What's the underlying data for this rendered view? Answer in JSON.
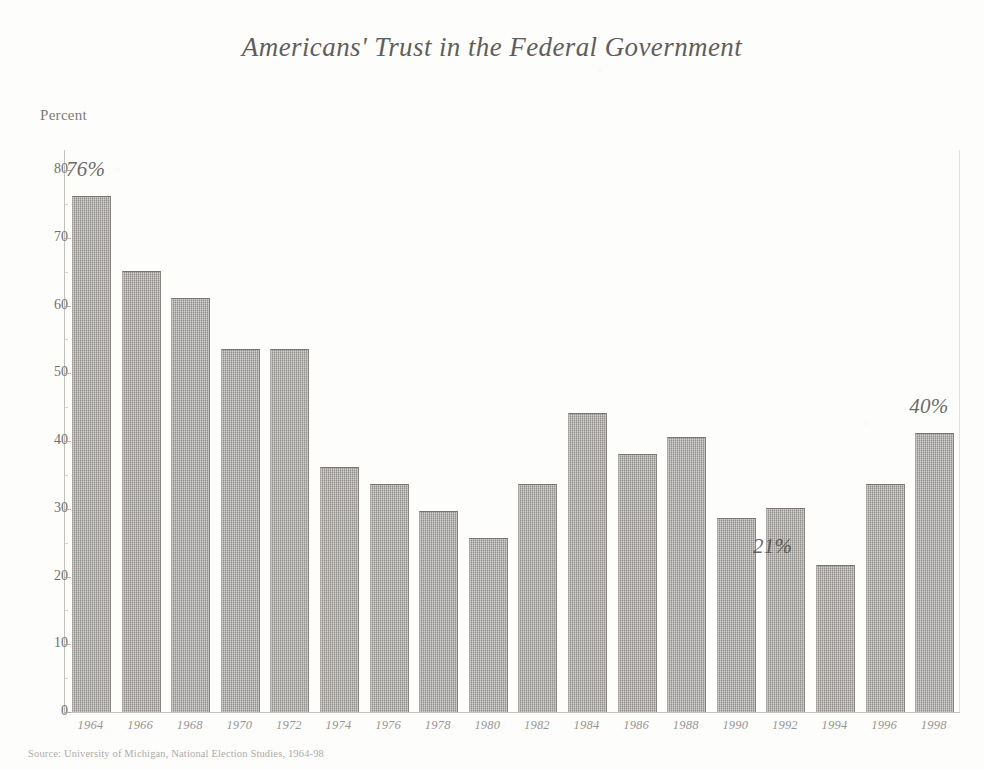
{
  "chart_data": {
    "type": "bar",
    "title": "Americans' Trust in the Federal Government",
    "xlabel": "",
    "ylabel": "Percent",
    "ylim": [
      0,
      80
    ],
    "grid": false,
    "legend": null,
    "categories": [
      "1964",
      "1966",
      "1968",
      "1970",
      "1972",
      "1974",
      "1976",
      "1978",
      "1980",
      "1982",
      "1984",
      "1986",
      "1988",
      "1990",
      "1992",
      "1994",
      "1996",
      "1998"
    ],
    "values": [
      76,
      65,
      61,
      53.5,
      53.5,
      36,
      33.5,
      29.5,
      25.5,
      33.5,
      44,
      38,
      40.5,
      28.5,
      30,
      21.5,
      33.5,
      41
    ],
    "y_ticks": [
      0,
      10,
      20,
      30,
      40,
      50,
      60,
      70,
      80
    ],
    "annotations": [
      {
        "text": "76%",
        "category": "1964",
        "value": 76,
        "placement": "above-bar"
      },
      {
        "text": "21%",
        "category": "1994",
        "value": 21.5,
        "placement": "left-of-bar"
      },
      {
        "text": "40%",
        "category": "1998",
        "value": 41,
        "placement": "above-bar"
      }
    ],
    "source": "Source: University of Michigan, National Election Studies, 1964-98",
    "bar_color": "#9b9894"
  }
}
